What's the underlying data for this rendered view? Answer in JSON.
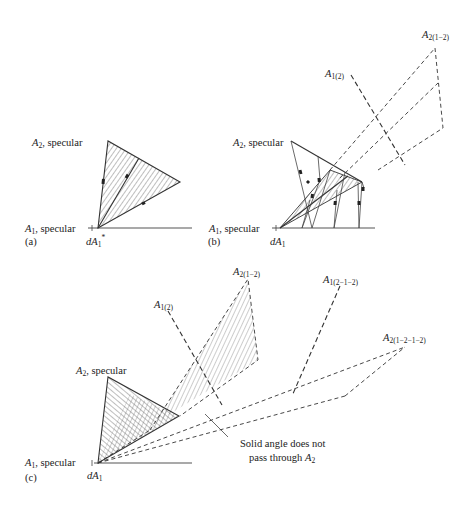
{
  "header": {
    "running_head": "Thermal Radiation Heat Transfer"
  },
  "panels": {
    "a": {
      "tag": "(a)",
      "a2_label": {
        "sym": "A",
        "sub": "2",
        "text": ", specular"
      },
      "a1_label": {
        "sym": "A",
        "sub": "1",
        "text": ", specular"
      },
      "da_label": {
        "sym": "dA",
        "sub": "1",
        "sup": "*"
      }
    },
    "b": {
      "tag": "(b)",
      "a2_label": {
        "sym": "A",
        "sub": "2",
        "text": ", specular"
      },
      "a1_label": {
        "sym": "A",
        "sub": "1",
        "text": ", specular"
      },
      "da_label": {
        "sym": "dA",
        "sub": "1"
      },
      "image1_label": {
        "sym": "A",
        "sub": "1(2)"
      },
      "image2_label": {
        "sym": "A",
        "sub": "2(1−2)"
      }
    },
    "c": {
      "tag": "(c)",
      "a2_label": {
        "sym": "A",
        "sub": "2",
        "text": ", specular"
      },
      "a1_label": {
        "sym": "A",
        "sub": "1",
        "text": ", specular"
      },
      "da_label": {
        "sym": "dA",
        "sub": "1"
      },
      "image1_label": {
        "sym": "A",
        "sub": "1(2)"
      },
      "image2_label": {
        "sym": "A",
        "sub": "2(1−2)"
      },
      "image3_label": {
        "sym": "A",
        "sub": "1(2−1−2)"
      },
      "image4_label": {
        "sym": "A",
        "sub": "2(1−2−1−2)"
      },
      "note_line1": "Solid angle does not",
      "note_line2": "pass through ",
      "note_sym": "A",
      "note_sub": "2"
    }
  },
  "colors": {
    "ink": "#333333",
    "background": "#ffffff"
  }
}
